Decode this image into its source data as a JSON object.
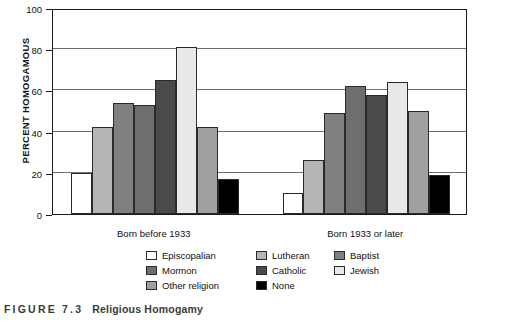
{
  "caption": {
    "figure_number": "FIGURE 7.3",
    "title": "Religious Homogamy"
  },
  "axis": {
    "ylabel": "PERCENT HOMOGAMOUS",
    "yticks": [
      "0",
      "20",
      "40",
      "60",
      "80",
      "100"
    ]
  },
  "groups": [
    {
      "label": "Born before 1933"
    },
    {
      "label": "Born 1933 or later"
    }
  ],
  "legend": [
    {
      "label": "Episcopalian",
      "color": "#ffffff"
    },
    {
      "label": "Lutheran",
      "color": "#b5b5b5"
    },
    {
      "label": "Baptist",
      "color": "#808080"
    },
    {
      "label": "Mormon",
      "color": "#6e6e6e"
    },
    {
      "label": "Catholic",
      "color": "#4a4a4a"
    },
    {
      "label": "Jewish",
      "color": "#e8e8e8"
    },
    {
      "label": "Other religion",
      "color": "#a0a0a0"
    },
    {
      "label": "None",
      "color": "#000000"
    }
  ],
  "chart_data": {
    "type": "bar",
    "title": "Religious Homogamy",
    "xlabel": "",
    "ylabel": "PERCENT HOMOGAMOUS",
    "ylim": [
      0,
      100
    ],
    "ytick_step": 20,
    "grid": true,
    "legend_position": "bottom",
    "categories": [
      "Born before 1933",
      "Born 1933 or later"
    ],
    "series": [
      {
        "name": "Episcopalian",
        "color": "#ffffff",
        "values": [
          20,
          10
        ]
      },
      {
        "name": "Lutheran",
        "color": "#b5b5b5",
        "values": [
          42,
          26
        ]
      },
      {
        "name": "Baptist",
        "color": "#808080",
        "values": [
          54,
          49
        ]
      },
      {
        "name": "Mormon",
        "color": "#6e6e6e",
        "values": [
          53,
          62
        ]
      },
      {
        "name": "Catholic",
        "color": "#4a4a4a",
        "values": [
          65,
          58
        ]
      },
      {
        "name": "Jewish",
        "color": "#e8e8e8",
        "values": [
          81,
          64
        ]
      },
      {
        "name": "Other religion",
        "color": "#a0a0a0",
        "values": [
          42,
          50
        ]
      },
      {
        "name": "None",
        "color": "#000000",
        "values": [
          17,
          19
        ]
      }
    ]
  }
}
